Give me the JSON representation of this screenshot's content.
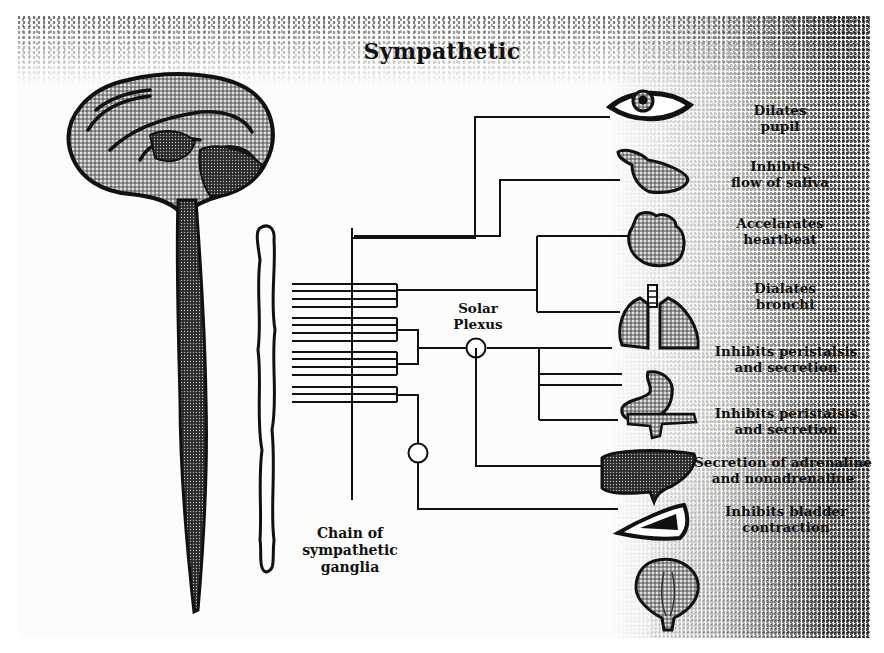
{
  "diagram": {
    "title": "Sympathetic",
    "colors": {
      "ink": "#111111",
      "paper": "#fcfcfa",
      "stipple": "#1a1a1a",
      "fill_gray": "#8a8a8a"
    },
    "center_labels": {
      "solar_plexus": {
        "line1": "Solar",
        "line2": "Plexus"
      },
      "chain": {
        "line1": "Chain of",
        "line2": "sympathetic",
        "line3": "ganglia"
      }
    },
    "organs": [
      {
        "id": "eye",
        "icon": "eye-icon",
        "effect_line1": "Dilates",
        "effect_line2": "pupil"
      },
      {
        "id": "salivary-gland",
        "icon": "salivary-gland-icon",
        "effect_line1": "Inhibits",
        "effect_line2": "flow of saliva"
      },
      {
        "id": "heart",
        "icon": "heart-icon",
        "effect_line1": "Accelarates",
        "effect_line2": "heartbeat"
      },
      {
        "id": "lungs",
        "icon": "lungs-icon",
        "effect_line1": "Dialates",
        "effect_line2": "bronchi"
      },
      {
        "id": "stomach",
        "icon": "stomach-icon",
        "effect_line1": "Inhibits peristalsis",
        "effect_line2": "and secretion"
      },
      {
        "id": "pancreas-intestine",
        "icon": "pancreas-icon",
        "effect_line1": "Inhibits peristalsis",
        "effect_line2": "and secretion"
      },
      {
        "id": "liver-adrenal",
        "icon": "liver-icon",
        "effect_line1": "Secretion of adrenaline",
        "effect_line2": "and nonadrenaline"
      },
      {
        "id": "kidney-adrenal",
        "icon": "adrenal-icon",
        "effect_line1": "Inhibits bladder",
        "effect_line2": "contraction"
      },
      {
        "id": "bladder",
        "icon": "bladder-icon",
        "effect_line1": "",
        "effect_line2": ""
      }
    ],
    "structures": {
      "brain": "brain-icon",
      "spinal_cord": "spinal-cord-icon",
      "ganglia_chain": "ganglia-chain-icon",
      "solar_plexus_node": "ganglion-node-icon",
      "lower_ganglion_node": "ganglion-node-icon"
    }
  }
}
